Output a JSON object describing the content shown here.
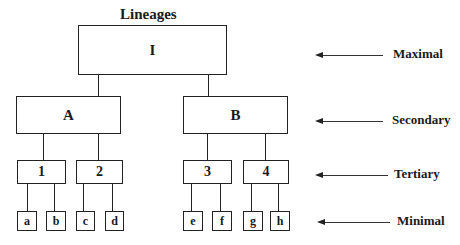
{
  "title": "Lineages",
  "nodes": {
    "maximal": "I",
    "secondary": [
      "A",
      "B"
    ],
    "tertiary": [
      "1",
      "2",
      "3",
      "4"
    ],
    "minimal": [
      "a",
      "b",
      "c",
      "d",
      "e",
      "f",
      "g",
      "h"
    ]
  },
  "levels": [
    {
      "label": "Maximal"
    },
    {
      "label": "Secondary"
    },
    {
      "label": "Tertiary"
    },
    {
      "label": "Minimal"
    }
  ]
}
